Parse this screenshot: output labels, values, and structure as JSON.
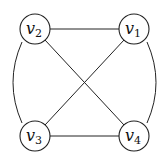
{
  "graph": {
    "nodes": [
      {
        "id": "v1",
        "base": "v",
        "sub": "1",
        "x": 134,
        "y": 29
      },
      {
        "id": "v2",
        "base": "v",
        "sub": "2",
        "x": 35,
        "y": 29
      },
      {
        "id": "v3",
        "base": "v",
        "sub": "3",
        "x": 35,
        "y": 136
      },
      {
        "id": "v4",
        "base": "v",
        "sub": "4",
        "x": 134,
        "y": 136
      }
    ],
    "edges": [
      {
        "from": "v2",
        "to": "v1",
        "type": "straight"
      },
      {
        "from": "v2",
        "to": "v4",
        "type": "straight"
      },
      {
        "from": "v1",
        "to": "v3",
        "type": "straight"
      },
      {
        "from": "v3",
        "to": "v4",
        "type": "straight"
      },
      {
        "from": "v2",
        "to": "v3",
        "type": "arc-left"
      },
      {
        "from": "v1",
        "to": "v4",
        "type": "arc-right"
      }
    ]
  }
}
